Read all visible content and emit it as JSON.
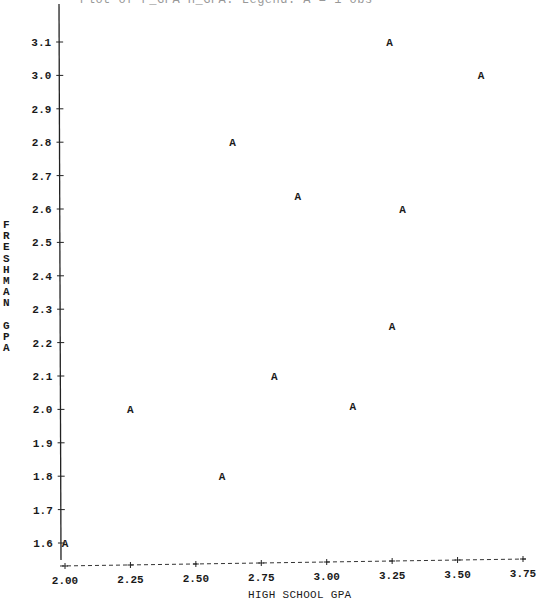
{
  "chart_data": {
    "type": "scatter",
    "title": "",
    "xlabel": "HIGH SCHOOL GPA",
    "ylabel": "FRESHMAN GPA",
    "marker": "A",
    "xlim": [
      2.0,
      3.75
    ],
    "ylim": [
      1.6,
      3.1
    ],
    "grid": false,
    "legend": null,
    "x_ticks": [
      "2.00",
      "2.25",
      "2.50",
      "2.75",
      "3.00",
      "3.25",
      "3.50",
      "3.75"
    ],
    "y_ticks": [
      "1.6",
      "1.7",
      "1.8",
      "1.9",
      "2.0",
      "2.1",
      "2.2",
      "2.3",
      "2.4",
      "2.5",
      "2.6",
      "2.7",
      "2.8",
      "2.9",
      "3.0",
      "3.1"
    ],
    "points": [
      {
        "x": 3.24,
        "y": 3.1
      },
      {
        "x": 3.59,
        "y": 3.0
      },
      {
        "x": 2.64,
        "y": 2.8
      },
      {
        "x": 2.89,
        "y": 2.64
      },
      {
        "x": 3.29,
        "y": 2.6
      },
      {
        "x": 3.25,
        "y": 2.25
      },
      {
        "x": 2.8,
        "y": 2.1
      },
      {
        "x": 2.25,
        "y": 2.0
      },
      {
        "x": 3.1,
        "y": 2.01
      },
      {
        "x": 2.6,
        "y": 1.8
      },
      {
        "x": 2.0,
        "y": 1.6
      }
    ]
  },
  "labels": {
    "title_fragment": "Plot of F_GPA*H_GPA.  Legend: A = 1 obs",
    "xlabel": "HIGH SCHOOL GPA",
    "ylabel_letters": [
      "F",
      "R",
      "E",
      "S",
      "H",
      "M",
      "A",
      "N",
      "",
      "G",
      "P",
      "A"
    ]
  }
}
